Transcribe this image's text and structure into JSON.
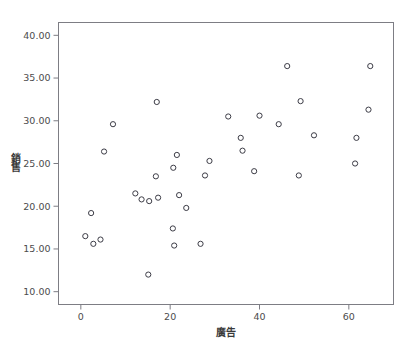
{
  "chart_data": {
    "type": "scatter",
    "title": "",
    "xlabel": "廣告",
    "ylabel": "銷售",
    "xlim": [
      -5,
      70
    ],
    "ylim": [
      8.5,
      41.5
    ],
    "grid": false,
    "legend": "none",
    "x_ticks": [
      {
        "value": 0,
        "label": "0"
      },
      {
        "value": 20,
        "label": "20"
      },
      {
        "value": 40,
        "label": "40"
      },
      {
        "value": 60,
        "label": "60"
      }
    ],
    "y_ticks": [
      {
        "value": 10,
        "label": "10.00"
      },
      {
        "value": 15,
        "label": "15.00"
      },
      {
        "value": 20,
        "label": "20.00"
      },
      {
        "value": 25,
        "label": "25.00"
      },
      {
        "value": 30,
        "label": "30.00"
      },
      {
        "value": 35,
        "label": "35.00"
      },
      {
        "value": 40,
        "label": "40.00"
      }
    ],
    "marker": {
      "shape": "circle-open",
      "radius": 2.6,
      "stroke": "#3c3c46",
      "fill": "none"
    },
    "points": [
      {
        "x": 1.0,
        "y": 16.5
      },
      {
        "x": 2.3,
        "y": 19.2
      },
      {
        "x": 2.8,
        "y": 15.6
      },
      {
        "x": 4.4,
        "y": 16.1
      },
      {
        "x": 5.2,
        "y": 26.4
      },
      {
        "x": 7.2,
        "y": 29.6
      },
      {
        "x": 12.2,
        "y": 21.5
      },
      {
        "x": 13.6,
        "y": 20.8
      },
      {
        "x": 15.1,
        "y": 12.0
      },
      {
        "x": 15.3,
        "y": 20.6
      },
      {
        "x": 16.8,
        "y": 23.5
      },
      {
        "x": 17.0,
        "y": 32.2
      },
      {
        "x": 17.3,
        "y": 21.0
      },
      {
        "x": 20.6,
        "y": 17.4
      },
      {
        "x": 20.7,
        "y": 24.5
      },
      {
        "x": 20.9,
        "y": 15.4
      },
      {
        "x": 21.5,
        "y": 26.0
      },
      {
        "x": 22.0,
        "y": 21.3
      },
      {
        "x": 23.6,
        "y": 19.8
      },
      {
        "x": 26.8,
        "y": 15.6
      },
      {
        "x": 27.8,
        "y": 23.6
      },
      {
        "x": 28.8,
        "y": 25.3
      },
      {
        "x": 33.0,
        "y": 30.5
      },
      {
        "x": 35.8,
        "y": 28.0
      },
      {
        "x": 36.2,
        "y": 26.5
      },
      {
        "x": 38.8,
        "y": 24.1
      },
      {
        "x": 40.0,
        "y": 30.6
      },
      {
        "x": 44.3,
        "y": 29.6
      },
      {
        "x": 46.2,
        "y": 36.4
      },
      {
        "x": 48.8,
        "y": 23.6
      },
      {
        "x": 49.2,
        "y": 32.3
      },
      {
        "x": 52.2,
        "y": 28.3
      },
      {
        "x": 61.4,
        "y": 25.0
      },
      {
        "x": 61.7,
        "y": 28.0
      },
      {
        "x": 64.4,
        "y": 31.3
      },
      {
        "x": 64.8,
        "y": 36.4
      }
    ]
  },
  "colors": {
    "frame": "#7d7d84",
    "marker_stroke": "#3c3c46",
    "text": "#4c4c4c",
    "background": "#ffffff"
  }
}
